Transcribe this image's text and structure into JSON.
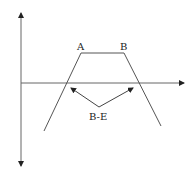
{
  "diagram": {
    "labels": {
      "peak_start": "A",
      "peak_end": "B",
      "arrow_label": "B-E"
    },
    "colors": {
      "stroke": "#333333",
      "axis": "#444444",
      "text": "#222222",
      "background": "#ffffff"
    }
  }
}
